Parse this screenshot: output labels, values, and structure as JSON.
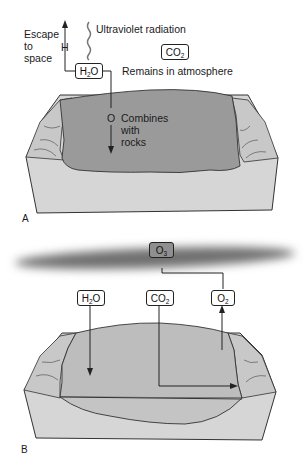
{
  "panel_a": {
    "panel_label": "A",
    "escape_label_lines": [
      "Escape",
      "to",
      "space"
    ],
    "hydrogen_label": "H",
    "uv_label": "Ultraviolet radiation",
    "h2o_box": {
      "base": "H",
      "sub": "2",
      "tail": "O"
    },
    "co2_box": {
      "base": "CO",
      "sub": "2",
      "tail": ""
    },
    "remains_label": "Remains in atmosphere",
    "oxygen_label": "O",
    "combines_label_lines": [
      "Combines",
      "with",
      "rocks"
    ]
  },
  "panel_b": {
    "panel_label": "B",
    "o3_box": {
      "base": "O",
      "sub": "3",
      "tail": ""
    },
    "h2o_box": {
      "base": "H",
      "sub": "2",
      "tail": "O"
    },
    "co2_box": {
      "base": "CO",
      "sub": "2",
      "tail": ""
    },
    "o2_box": {
      "base": "O",
      "sub": "2",
      "tail": ""
    }
  },
  "colors": {
    "water": "#9a9a9a",
    "land": "#d4d4d4",
    "water_b": "#b9b9b9",
    "ozone_band": "#707070"
  }
}
